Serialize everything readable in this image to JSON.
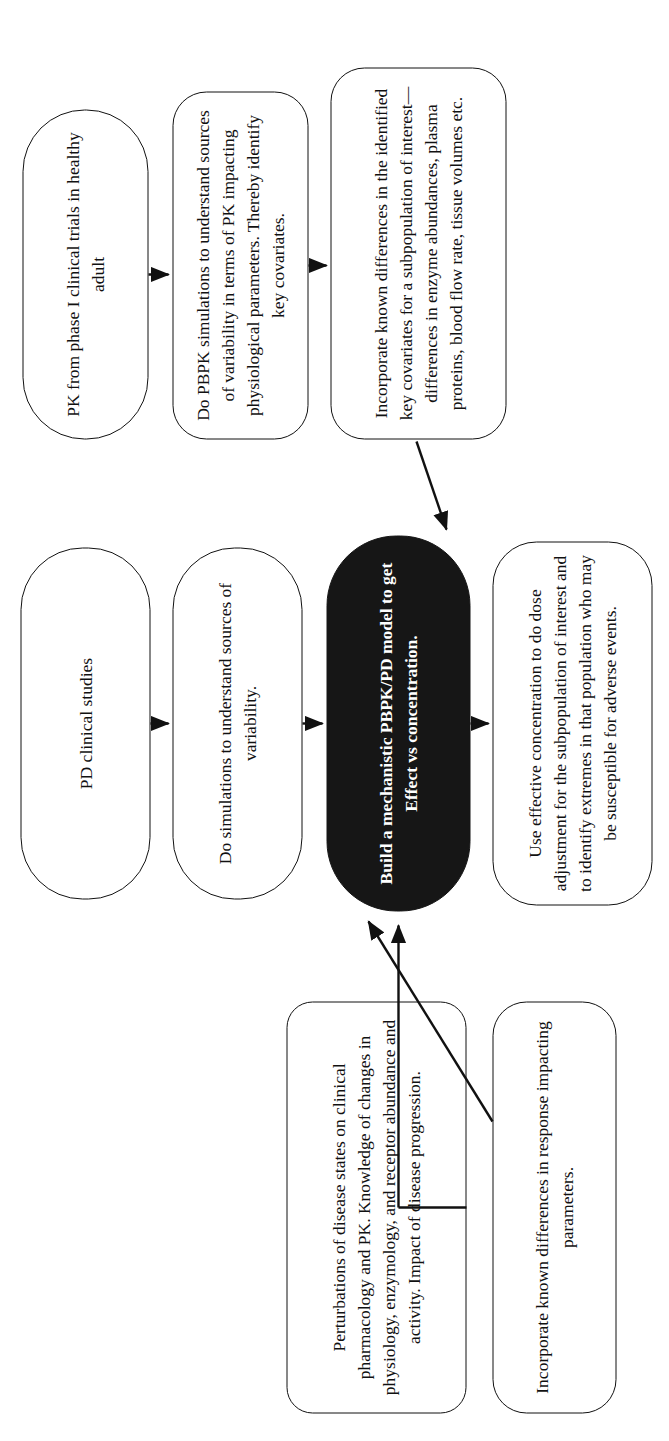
{
  "diagram": {
    "orientation": "rotated-90-ccw",
    "colors": {
      "stroke": "#111111",
      "background": "#ffffff",
      "highlight_fill": "#161616",
      "highlight_text": "#ffffff"
    },
    "nodes": [
      {
        "id": "pd-clinical-studies",
        "label": "PD clinical studies",
        "style": "outline"
      },
      {
        "id": "do-simulations-variability",
        "label": "Do simulations to understand sources of variability.",
        "style": "outline"
      },
      {
        "id": "build-mechanistic-model",
        "label": "Build a mechanistic PBPK/PD model to get Effect vs concentration.",
        "style": "filled"
      },
      {
        "id": "use-effective-concentration",
        "label": "Use effective concentration to do dose adjustment for the subpopulation of interest and to identify extremes in that population who may be susceptible for adverse events.",
        "style": "outline"
      },
      {
        "id": "perturbations-disease-states",
        "label": "Perturbations of disease states on clinical pharmacology and PK. Knowledge of changes in physiology, enzymology, and receptor abundance and activity. Impact of disease progression.",
        "style": "outline"
      },
      {
        "id": "incorporate-response-parameters",
        "label": "Incorporate known differences in response impacting parameters.",
        "style": "outline"
      },
      {
        "id": "pk-phase-i-trials",
        "label": "PK from phase I clinical trials in healthy adult",
        "style": "outline"
      },
      {
        "id": "do-pbpk-simulations",
        "label": "Do PBPK simulations to understand sources of variability in terms of PK impacting physiological parameters. Thereby identify key covariates.",
        "style": "outline"
      },
      {
        "id": "incorporate-key-covariates",
        "label": "Incorporate known differences in the identified key covariates for a subpopulation of interest—differences in enzyme abundances, plasma proteins, blood flow rate, tissue volumes etc.",
        "style": "outline"
      }
    ],
    "edges": [
      {
        "id": "edge-pd-to-sims",
        "from": "pd-clinical-studies",
        "to": "do-simulations-variability",
        "kind": "straight-arrow"
      },
      {
        "id": "edge-sims-to-model",
        "from": "do-simulations-variability",
        "to": "build-mechanistic-model",
        "kind": "straight-arrow"
      },
      {
        "id": "edge-model-to-use",
        "from": "build-mechanistic-model",
        "to": "use-effective-concentration",
        "kind": "straight-arrow"
      },
      {
        "id": "edge-pk-to-pbpk",
        "from": "pk-phase-i-trials",
        "to": "do-pbpk-simulations",
        "kind": "straight-arrow"
      },
      {
        "id": "edge-pbpk-to-covariates",
        "from": "do-pbpk-simulations",
        "to": "incorporate-key-covariates",
        "kind": "straight-arrow"
      },
      {
        "id": "edge-perturbations-to-model",
        "from": "perturbations-disease-states",
        "to": "build-mechanistic-model",
        "kind": "straight-arrow"
      },
      {
        "id": "edge-response-to-model",
        "from": "incorporate-response-parameters",
        "to": "build-mechanistic-model",
        "kind": "diagonal-arrow"
      },
      {
        "id": "edge-covariates-to-model",
        "from": "incorporate-key-covariates",
        "to": "build-mechanistic-model",
        "kind": "diagonal-arrow"
      }
    ]
  }
}
